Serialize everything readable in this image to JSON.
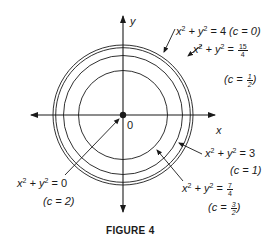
{
  "figure": {
    "caption": "FIGURE 4",
    "axes": {
      "x_label": "x",
      "y_label": "y",
      "origin_label": "0"
    },
    "origin_px": [
      123,
      115
    ],
    "scale_px_per_unit": 35,
    "curves": [
      {
        "eq_lhs": "x",
        "eq_mid": "+ y",
        "eq_rhs": "= 4",
        "c_label": "(c = 0)",
        "radius": 2
      },
      {
        "eq_lhs": "x",
        "eq_mid": "+ y",
        "eq_rhs": "=",
        "rhs_num": "15",
        "rhs_den": "4",
        "c_pre": "(c =",
        "c_num": "1",
        "c_den": "2",
        "c_post": ")",
        "radius": 1.9365
      },
      {
        "eq_lhs": "x",
        "eq_mid": "+ y",
        "eq_rhs": "= 3",
        "c_label": "(c = 1)",
        "radius": 1.7321
      },
      {
        "eq_lhs": "x",
        "eq_mid": "+ y",
        "eq_rhs": "=",
        "rhs_num": "7",
        "rhs_den": "4",
        "c_pre": "(c =",
        "c_num": "3",
        "c_den": "2",
        "c_post": ")",
        "radius": 1.3229
      },
      {
        "eq_lhs": "x",
        "eq_mid": "+ y",
        "eq_rhs": "= 0",
        "c_label": "(c = 2)",
        "radius": 0
      }
    ],
    "exponent": "2",
    "colors": {
      "ink": "#1a1a1a",
      "background": "#ffffff"
    }
  }
}
